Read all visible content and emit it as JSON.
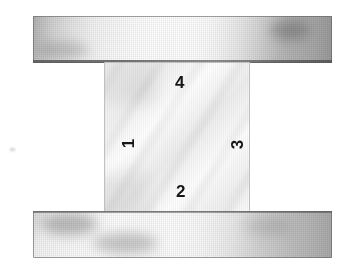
{
  "figure": {
    "background_color": "#ffffff",
    "width": 349,
    "height": 271,
    "platen_top": {
      "name": "upper platen",
      "color_dark": "#9d9d9d",
      "color_light": "#fdfdfd"
    },
    "platen_bottom": {
      "name": "lower platen",
      "color_dark": "#a6a6a6",
      "color_light": "#fafafa"
    },
    "specimen": {
      "name": "square specimen",
      "fill_color": "#f3f3f3",
      "border_color": "#969696"
    },
    "edge_labels": [
      {
        "id": "1",
        "text": "1",
        "edge": "left",
        "rotation_deg": -90
      },
      {
        "id": "2",
        "text": "2",
        "edge": "bottom",
        "rotation_deg": 0
      },
      {
        "id": "3",
        "text": "3",
        "edge": "right",
        "rotation_deg": -90
      },
      {
        "id": "4",
        "text": "4",
        "edge": "top",
        "rotation_deg": 0
      }
    ]
  }
}
